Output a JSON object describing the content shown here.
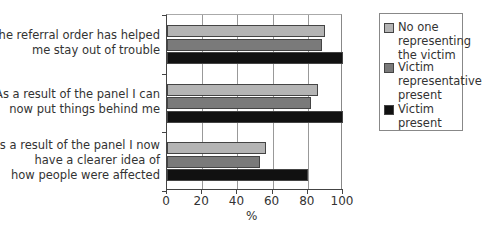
{
  "chart_data": {
    "type": "bar",
    "orientation": "horizontal",
    "title": "",
    "xlabel": "%",
    "ylabel": "",
    "xlim": [
      0,
      100
    ],
    "xticks": [
      "0",
      "20",
      "40",
      "60",
      "80",
      "100"
    ],
    "grid": true,
    "legend_position": "right",
    "categories": [
      "The referral order has helped me stay out of trouble",
      "As a result of the panel I can now put things behind me",
      "As a result of the panel I now have a clearer idea of how people were affected"
    ],
    "category_lines": [
      [
        "The referral order has helped",
        "me stay out of trouble"
      ],
      [
        "As a result of the panel I can",
        "now put things behind me"
      ],
      [
        "As a result of the panel I now",
        "have a clearer idea of",
        "how people were affected"
      ]
    ],
    "series": [
      {
        "name": "No one representing the victim",
        "legend_lines": [
          "No one",
          "representing",
          "the victim"
        ],
        "color": "#b4b4b4",
        "values": [
          90,
          86,
          56
        ]
      },
      {
        "name": "Victim representative present",
        "legend_lines": [
          "Victim",
          "representative",
          "present"
        ],
        "color": "#7a7a7a",
        "values": [
          88,
          82,
          53
        ]
      },
      {
        "name": "Victim present",
        "legend_lines": [
          "Victim",
          "present"
        ],
        "color": "#111111",
        "values": [
          100,
          100,
          80
        ]
      }
    ]
  }
}
